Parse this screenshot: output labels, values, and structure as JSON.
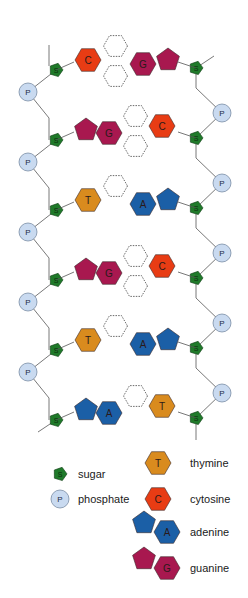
{
  "corner_mark": "",
  "colors": {
    "sugar": "#1f7a2a",
    "phosphate": "#c9daf0",
    "thymine": "#d98b1e",
    "cytosine": "#e83c14",
    "adenine": "#1b5fa6",
    "guanine": "#a8184f",
    "backbone": "#555555",
    "hbond": "#444444"
  },
  "labels": {
    "sugar_glyph": "S",
    "phosphate_glyph": "P",
    "T": "T",
    "C": "C",
    "A": "A",
    "G": "G"
  },
  "base_pairs": [
    {
      "left": "C",
      "right": "G"
    },
    {
      "left": "G",
      "right": "C"
    },
    {
      "left": "T",
      "right": "A"
    },
    {
      "left": "G",
      "right": "C"
    },
    {
      "left": "T",
      "right": "A"
    },
    {
      "left": "A",
      "right": "T"
    }
  ],
  "legend": {
    "sugar": "sugar",
    "phosphate": "phosphate",
    "thymine": "thymine",
    "cytosine": "cytosine",
    "adenine": "adenine",
    "guanine": "guanine"
  }
}
